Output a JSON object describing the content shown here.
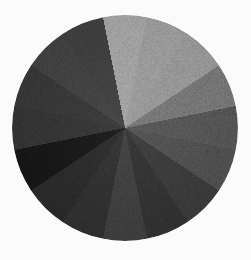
{
  "figure": {
    "background_color": "#fbfbfb",
    "width": 251,
    "height": 260
  },
  "chart_data": {
    "type": "pie",
    "title": "",
    "subtitle": "",
    "xlabel": "",
    "ylabel": "",
    "grid": false,
    "legend": "none",
    "labels_shown": false,
    "slice_count": 16,
    "equal_angles": true,
    "slice_angle_degrees": 22.5,
    "start_angle_degrees": -11.25,
    "center": {
      "x": 125,
      "y": 128
    },
    "radius": 113,
    "categories": [
      "S1",
      "S2",
      "S3",
      "S4",
      "S5",
      "S6",
      "S7",
      "S8",
      "S9",
      "S10",
      "S11",
      "S12",
      "S13",
      "S14",
      "S15",
      "S16"
    ],
    "values": [
      6.25,
      6.25,
      6.25,
      6.25,
      6.25,
      6.25,
      6.25,
      6.25,
      6.25,
      6.25,
      6.25,
      6.25,
      6.25,
      6.25,
      6.25,
      6.25
    ],
    "colors": [
      "#9a9a9a",
      "#929292",
      "#8f8f8f",
      "#6e6e6e",
      "#4f4f4f",
      "#4a4a4a",
      "#363636",
      "#2e2e2e",
      "#3a3a3a",
      "#2c2c2c",
      "#272727",
      "#151515",
      "#303030",
      "#333333",
      "#3c3c3c",
      "#3a3a3a"
    ],
    "color_scale": "grayscale",
    "lightest_color": "#9a9a9a",
    "darkest_color": "#151515"
  }
}
